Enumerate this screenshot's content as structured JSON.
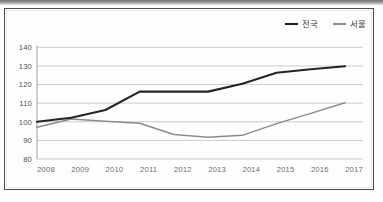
{
  "figure": {
    "frame_color": "#4a4a4a",
    "background": "#ffffff"
  },
  "chart_data": {
    "type": "line",
    "title": "",
    "subtitle": "",
    "xlabel": "",
    "ylabel": "",
    "x": [
      2008,
      2009,
      2010,
      2011,
      2012,
      2013,
      2014,
      2015,
      2016,
      2017
    ],
    "categories": [
      "2008",
      "2009",
      "2010",
      "2011",
      "2012",
      "2013",
      "2014",
      "2015",
      "2016",
      "2017"
    ],
    "ylim": [
      80,
      145
    ],
    "yticks": [
      80,
      90,
      100,
      110,
      120,
      130,
      140
    ],
    "ytick_labels": [
      "80",
      "90",
      "100",
      "110",
      "120",
      "130",
      "140"
    ],
    "grid": true,
    "grid_axis": "y",
    "legend_position": "top-right",
    "baseline_value": 100,
    "series": [
      {
        "name": "전국",
        "color": "#242424",
        "width": 2.1,
        "values": [
          100.0,
          102.2,
          106.3,
          116.2,
          116.2,
          116.2,
          120.4,
          126.3,
          128.2,
          129.8
        ]
      },
      {
        "name": "서울",
        "color": "#8c8c8c",
        "width": 1.5,
        "values": [
          97.0,
          101.5,
          100.3,
          99.2,
          93.2,
          91.7,
          92.7,
          99.0,
          104.5,
          110.2
        ]
      }
    ]
  },
  "legend": {
    "items": [
      {
        "label": "전국",
        "color": "#242424"
      },
      {
        "label": "서울",
        "color": "#8c8c8c"
      }
    ]
  }
}
